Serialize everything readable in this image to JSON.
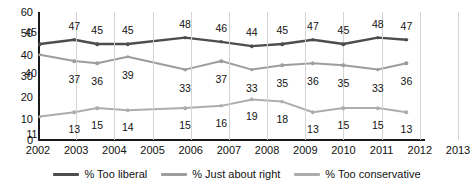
{
  "chart_data": {
    "type": "line",
    "title": "",
    "xlabel": "",
    "ylabel": "",
    "ylim": [
      0,
      60
    ],
    "ytick_labels": [
      "0",
      "10",
      "20",
      "30",
      "40",
      "50",
      "60"
    ],
    "ytick_values": [
      0,
      10,
      20,
      30,
      40,
      50,
      60
    ],
    "categories": [
      "2002",
      "2003",
      "2004",
      "2005",
      "2006",
      "2007",
      "2008",
      "2009",
      "2010",
      "2011",
      "2012",
      "2013"
    ],
    "x_axis_range": [
      2002,
      2013
    ],
    "grid": "vertical",
    "legend_position": "bottom",
    "series": [
      {
        "name": "% Too liberal",
        "color": "#4d4d4d",
        "x": [
          2002.05,
          2002.95,
          2003.55,
          2004.35,
          2005.85,
          2006.8,
          2007.6,
          2008.4,
          2009.2,
          2010.0,
          2010.9,
          2011.65
        ],
        "values": [
          45,
          47,
          45,
          45,
          48,
          46,
          44,
          45,
          47,
          45,
          48,
          47
        ],
        "labels": [
          "45",
          "47",
          "45",
          "45",
          "48",
          "46",
          "44",
          "45",
          "47",
          "45",
          "48",
          "47"
        ]
      },
      {
        "name": "% Just about right",
        "color": "#9d9d9d",
        "x": [
          2002.05,
          2002.95,
          2003.55,
          2004.35,
          2005.85,
          2006.8,
          2007.6,
          2008.4,
          2009.2,
          2010.0,
          2010.9,
          2011.65
        ],
        "values": [
          40,
          37,
          36,
          39,
          33,
          37,
          33,
          35,
          36,
          35,
          33,
          36
        ],
        "labels": [
          "40",
          "37",
          "36",
          "39",
          "33",
          "37",
          "33",
          "35",
          "36",
          "35",
          "33",
          "36"
        ]
      },
      {
        "name": "% Too conservative",
        "color": "#adadad",
        "x": [
          2002.05,
          2002.95,
          2003.55,
          2004.35,
          2005.85,
          2006.8,
          2007.6,
          2008.4,
          2009.2,
          2010.0,
          2010.9,
          2011.65
        ],
        "values": [
          11,
          13,
          15,
          14,
          15,
          16,
          19,
          18,
          13,
          15,
          15,
          13
        ],
        "labels": [
          "11",
          "13",
          "15",
          "14",
          "15",
          "16",
          "19",
          "18",
          "13",
          "15",
          "15",
          "13"
        ]
      }
    ],
    "label_offsets": [
      [
        -9,
        -18
      ],
      [
        0,
        -19
      ],
      [
        0,
        -19
      ],
      [
        0,
        -19
      ],
      [
        0,
        -19
      ],
      [
        0,
        -19
      ],
      [
        0,
        -19
      ],
      [
        0,
        -19
      ],
      [
        0,
        -19
      ],
      [
        0,
        -19
      ],
      [
        0,
        -19
      ],
      [
        0,
        -19
      ]
    ]
  }
}
